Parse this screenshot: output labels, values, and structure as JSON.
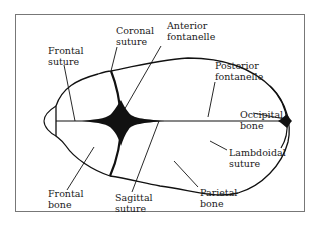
{
  "diagram": {
    "labels": {
      "coronal_suture": [
        "Coronal",
        "suture"
      ],
      "anterior_fontanelle": [
        "Anterior",
        "fontanelle"
      ],
      "frontal_suture": [
        "Frontal",
        "suture"
      ],
      "posterior_fontanelle": [
        "Posterior",
        "fontanelle"
      ],
      "occipital_bone": [
        "Occipital",
        "bone"
      ],
      "lambdoidal_suture": [
        "Lambdoidal",
        "suture"
      ],
      "frontal_bone": [
        "Frontal",
        "bone"
      ],
      "sagittal_suture": [
        "Sagittal",
        "suture"
      ],
      "parietal_bone": [
        "Parietal",
        "bone"
      ]
    },
    "colors": {
      "ink": "#111111",
      "frame": "#777777",
      "background": "#ffffff"
    }
  }
}
